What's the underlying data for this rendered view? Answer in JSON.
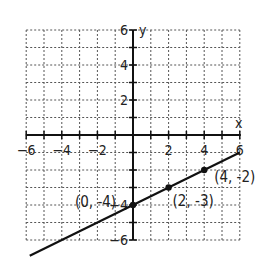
{
  "chart_data": {
    "type": "line",
    "title": "",
    "xlabel": "x",
    "ylabel": "y",
    "xlim": [
      -6,
      6
    ],
    "ylim": [
      -6,
      6
    ],
    "grid": true,
    "grid_style": "dotted",
    "x_ticks": [
      -6,
      -4,
      -2,
      2,
      4,
      6
    ],
    "y_ticks": [
      6,
      4,
      2,
      -4,
      -6
    ],
    "x_tick_labels": [
      "-6",
      "-4",
      "-2",
      "2",
      "4",
      "6"
    ],
    "y_tick_labels": [
      "6",
      "4",
      "2",
      "4",
      "6"
    ],
    "series": [
      {
        "name": "y = 0.5x - 4",
        "slope": 0.5,
        "intercept": -4,
        "x_range": [
          -5.8,
          6
        ],
        "color": "#111111"
      }
    ],
    "points": [
      {
        "x": 0,
        "y": -4,
        "label": "(0, -4)"
      },
      {
        "x": 2,
        "y": -3,
        "label": "(2, -3)"
      },
      {
        "x": 4,
        "y": -2,
        "label": "(4, -2)"
      }
    ]
  }
}
